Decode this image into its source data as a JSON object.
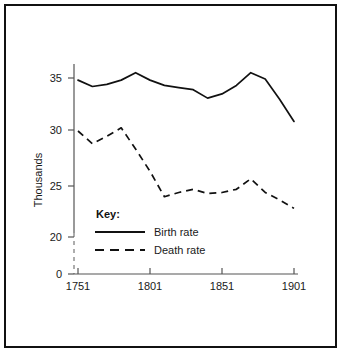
{
  "chart_data": {
    "type": "line",
    "title": "",
    "xlabel": "",
    "ylabel": "Thousands",
    "xlim": [
      1751,
      1901
    ],
    "ylim": [
      20,
      36
    ],
    "grid": false,
    "axis_break": true,
    "x_ticks": [
      1751,
      1801,
      1851,
      1901
    ],
    "y_ticks": [
      0,
      20,
      25,
      30,
      35
    ],
    "legend": {
      "title": "Key:",
      "position": "inside-lower-left",
      "entries": [
        {
          "name": "Birth rate",
          "style": "solid"
        },
        {
          "name": "Death rate",
          "style": "dashed"
        }
      ]
    },
    "series": [
      {
        "name": "Birth rate",
        "style": "solid",
        "x": [
          1751,
          1761,
          1771,
          1781,
          1791,
          1801,
          1811,
          1821,
          1831,
          1841,
          1851,
          1861,
          1871,
          1881,
          1891,
          1901
        ],
        "values": [
          34.8,
          34.2,
          34.4,
          34.8,
          35.5,
          34.8,
          34.3,
          34.1,
          33.9,
          33.1,
          33.5,
          34.3,
          35.5,
          34.9,
          33.0,
          30.9
        ]
      },
      {
        "name": "Death rate",
        "style": "dashed",
        "x": [
          1751,
          1761,
          1771,
          1781,
          1791,
          1801,
          1811,
          1821,
          1831,
          1841,
          1851,
          1861,
          1871,
          1881,
          1891,
          1901
        ],
        "values": [
          30.0,
          28.8,
          29.5,
          30.3,
          28.3,
          26.2,
          23.8,
          24.2,
          24.5,
          24.1,
          24.2,
          24.5,
          25.5,
          24.2,
          23.5,
          22.7
        ]
      }
    ]
  },
  "axes": {
    "y_title": "Thousands",
    "y_tick_labels": [
      "35",
      "30",
      "25",
      "20",
      "0"
    ],
    "x_tick_labels": [
      "1751",
      "1801",
      "1851",
      "1901"
    ]
  },
  "legend": {
    "title": "Key:",
    "birth_label": "Birth rate",
    "death_label": "Death rate"
  },
  "colors": {
    "line": "#111111",
    "axis": "#555555",
    "frame": "#111111",
    "background": "#ffffff"
  }
}
